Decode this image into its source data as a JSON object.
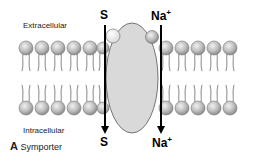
{
  "figure": {
    "panel_letter": "A",
    "panel_title": "Symporter",
    "labels": {
      "extracellular": "Extracellular",
      "intracellular": "Intracellular"
    },
    "substrates": {
      "top_left": "S",
      "top_right_base": "Na",
      "top_right_charge": "+",
      "bottom_left": "S",
      "bottom_right_base": "Na",
      "bottom_right_charge": "+"
    },
    "colors": {
      "lipid_head": "#b8b8b8",
      "protein": "#d9d9d9",
      "arrow": "#000000"
    }
  }
}
